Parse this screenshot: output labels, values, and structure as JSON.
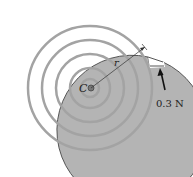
{
  "diagram": {
    "type": "spiral-disk-force",
    "center_label": "C",
    "radius_label": "r",
    "force_label": "0.3 N",
    "colors": {
      "disk_fill": "#b3b3b3",
      "spiral_line": "#9a9a9a",
      "outline": "#555555",
      "plume": "#e6e6e6",
      "text": "#222222"
    }
  }
}
